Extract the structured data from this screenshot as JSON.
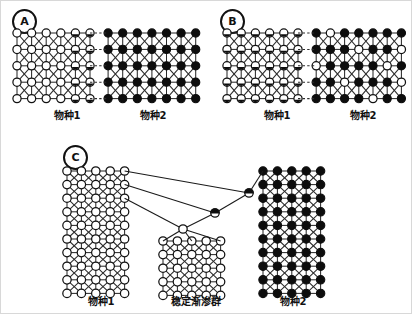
{
  "figure": {
    "title_present": false,
    "background": "#ffffff",
    "border_color": "#d8d8d8",
    "node_colors": {
      "species1": "#ffffff",
      "species2": "#0d0d0d",
      "outline": "#111111",
      "edge": "#2b2b2b"
    }
  },
  "panels": [
    {
      "id": "A",
      "badge": "A",
      "captions": [
        {
          "text": "物种1",
          "role": "species-1-label"
        },
        {
          "text": "物种2",
          "role": "species-2-label"
        }
      ],
      "lattices": [
        {
          "name": "species1-lattice",
          "type": "open",
          "cols": 6,
          "rows": 5,
          "marked_cols": [
            4,
            5
          ],
          "note": "open circles; two rightmost columns carry small introgressed dots"
        },
        {
          "name": "species2-lattice",
          "type": "filled",
          "cols": 7,
          "rows": 5,
          "marked_cols": [],
          "note": "solid black circles"
        }
      ],
      "description": "Two parental populations in contact; slight allele leakage at the boundary."
    },
    {
      "id": "B",
      "badge": "B",
      "captions": [
        {
          "text": "物种1",
          "role": "species-1-label"
        },
        {
          "text": "物种2",
          "role": "species-2-label"
        }
      ],
      "lattices": [
        {
          "name": "species1-lattice",
          "type": "open",
          "cols": 6,
          "rows": 5,
          "marked_cols": [
            0,
            1,
            2,
            3,
            4,
            5
          ],
          "note": "all open circles carry introgressed dots"
        },
        {
          "name": "species2-lattice",
          "type": "filled",
          "cols": 7,
          "rows": 5,
          "marked_cols": [],
          "open_cells": [
            [
              0,
              1
            ],
            [
              1,
              3
            ],
            [
              2,
              0
            ],
            [
              2,
              5
            ],
            [
              3,
              2
            ],
            [
              4,
              4
            ],
            [
              1,
              6
            ],
            [
              3,
              6
            ]
          ],
          "note": "black lattice with scattered open circles from species 1"
        }
      ],
      "description": "Widespread bidirectional introgression across the hybrid zone."
    },
    {
      "id": "C",
      "badge": "C",
      "captions": [
        {
          "text": "物种1",
          "role": "species-1-label"
        },
        {
          "text": "稳定渐渗群",
          "role": "stable-introgression-label"
        },
        {
          "text": "物种2",
          "role": "species-2-label"
        }
      ],
      "lattices": [
        {
          "name": "species1-lattice",
          "type": "open",
          "cols": 5,
          "rows": 10,
          "marked_cols": [],
          "note": "large open-circle parental population"
        },
        {
          "name": "stable-introgression-lattice",
          "type": "open",
          "cols": 5,
          "rows": 5,
          "marked_cols": [],
          "note": "derived stable introgressed population fanning from a single apex node"
        },
        {
          "name": "species2-lattice",
          "type": "filled",
          "cols": 5,
          "rows": 10,
          "marked_cols": [],
          "note": "large solid-black parental population"
        }
      ],
      "hybrid_chain": {
        "name": "hybrid-node-chain",
        "count": 3,
        "types": [
          "half",
          "half",
          "open"
        ],
        "note": "chain of hybrid individuals bridging species 1, species 2 and the stable introgression group"
      },
      "description": "Hybridisation produces a persistent, self-sustaining introgressed lineage."
    }
  ]
}
